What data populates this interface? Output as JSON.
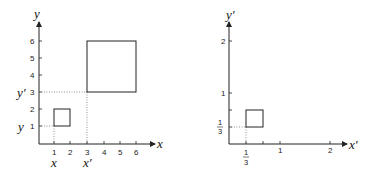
{
  "left_plot": {
    "x_axis_label": "x",
    "y_axis_label": "y",
    "x_ticks": [
      "1",
      "2",
      "3",
      "4",
      "5",
      "6"
    ],
    "y_ticks": [
      "1",
      "2",
      "3",
      "4",
      "5",
      "6"
    ],
    "x_markers": [
      "x",
      "x′"
    ],
    "y_markers": [
      "y",
      "y′"
    ],
    "small_square": {
      "x0": 1,
      "y0": 1,
      "x1": 2,
      "y1": 2
    },
    "large_square": {
      "x0": 3,
      "y0": 3,
      "x1": 6,
      "y1": 6
    }
  },
  "right_plot": {
    "x_axis_label": "x′",
    "y_axis_label": "y′",
    "x_ticks": [
      "1",
      "2"
    ],
    "y_ticks": [
      "1",
      "2"
    ],
    "frac_num": "1",
    "frac_den": "3",
    "square": {
      "x0": 0.3333,
      "y0": 0.3333,
      "x1": 0.6667,
      "y1": 0.6667
    }
  },
  "colors": {
    "axis": "#222222",
    "dotted": "#777777",
    "box": "#222222"
  }
}
